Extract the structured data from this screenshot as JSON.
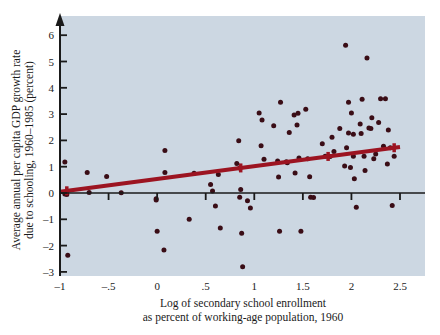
{
  "chart_data": {
    "type": "scatter",
    "title": "",
    "xlabel": "Log of secondary school enrollment as percent of working-age population, 1960",
    "xlabel_line1": "Log of secondary school enrollment",
    "xlabel_line2": "as percent of working-age population, 1960",
    "ylabel": "Average annual per capita GDP growth rate due to schooling, 1960–1985 (percent)",
    "ylabel_line1": "Average annual per capita GDP growth rate",
    "ylabel_line2": "due to schooling, 1960–1985 (percent)",
    "xlim": [
      -1,
      2.5
    ],
    "ylim": [
      -3,
      6.4
    ],
    "grid": false,
    "legend": "none",
    "xticks": [
      -1,
      -0.5,
      0,
      0.5,
      1,
      1.5,
      2,
      2.5
    ],
    "xtick_labels": [
      "–1",
      "–.5",
      "0",
      ".5",
      "1",
      "1.5",
      "2",
      "2.5"
    ],
    "yticks": [
      -3,
      -2,
      -1,
      0,
      1,
      2,
      3,
      4,
      5,
      6
    ],
    "ytick_labels": [
      "–3",
      "–2",
      "–1",
      "0",
      "1",
      "2",
      "3",
      "4",
      "5",
      "6"
    ],
    "point_color": "#3a0d16",
    "line_color": "#9c1421",
    "plot_bg_color": "#ccd7e2",
    "axis_color": "#1a1a1a",
    "trendline": {
      "x": [
        -1.0,
        2.5
      ],
      "y": [
        0.05,
        1.75
      ],
      "slope": 0.486,
      "intercept": 0.536,
      "markers_x": [
        -0.93,
        0.86,
        1.76,
        2.44
      ]
    },
    "points": [
      {
        "x": -0.95,
        "y": 1.18
      },
      {
        "x": -0.95,
        "y": -0.04
      },
      {
        "x": -0.93,
        "y": -0.06
      },
      {
        "x": -0.92,
        "y": -2.37
      },
      {
        "x": -0.72,
        "y": 0.78
      },
      {
        "x": -0.7,
        "y": 0.02
      },
      {
        "x": -0.52,
        "y": 0.63
      },
      {
        "x": -0.37,
        "y": 0.01
      },
      {
        "x": 0.08,
        "y": 1.62
      },
      {
        "x": 0.08,
        "y": 0.78
      },
      {
        "x": -0.01,
        "y": -0.22
      },
      {
        "x": -0.01,
        "y": -0.27
      },
      {
        "x": 0.0,
        "y": -1.45
      },
      {
        "x": 0.07,
        "y": -2.17
      },
      {
        "x": 0.33,
        "y": -1.0
      },
      {
        "x": 0.38,
        "y": 0.75
      },
      {
        "x": 0.55,
        "y": 0.32
      },
      {
        "x": 0.57,
        "y": 0.08
      },
      {
        "x": 0.6,
        "y": -0.49
      },
      {
        "x": 0.63,
        "y": 0.7
      },
      {
        "x": 0.65,
        "y": -1.33
      },
      {
        "x": 0.82,
        "y": 1.12
      },
      {
        "x": 0.84,
        "y": 1.99
      },
      {
        "x": 0.85,
        "y": 0.95
      },
      {
        "x": 0.86,
        "y": 0.13
      },
      {
        "x": 0.85,
        "y": -0.16
      },
      {
        "x": 0.87,
        "y": -1.53
      },
      {
        "x": 0.88,
        "y": -2.8
      },
      {
        "x": 0.93,
        "y": -0.29
      },
      {
        "x": 0.96,
        "y": -0.57
      },
      {
        "x": 1.05,
        "y": 3.04
      },
      {
        "x": 1.08,
        "y": 2.78
      },
      {
        "x": 1.07,
        "y": 1.8
      },
      {
        "x": 1.1,
        "y": 1.28
      },
      {
        "x": 1.2,
        "y": 2.56
      },
      {
        "x": 1.24,
        "y": 1.22
      },
      {
        "x": 1.25,
        "y": 0.61
      },
      {
        "x": 1.27,
        "y": 3.45
      },
      {
        "x": 1.26,
        "y": -1.45
      },
      {
        "x": 1.33,
        "y": 1.19
      },
      {
        "x": 1.34,
        "y": 1.15
      },
      {
        "x": 1.36,
        "y": 2.3
      },
      {
        "x": 1.41,
        "y": 2.97
      },
      {
        "x": 1.42,
        "y": 0.76
      },
      {
        "x": 1.44,
        "y": 2.59
      },
      {
        "x": 1.45,
        "y": 3.03
      },
      {
        "x": 1.46,
        "y": 1.33
      },
      {
        "x": 1.48,
        "y": -1.45
      },
      {
        "x": 1.53,
        "y": 3.18
      },
      {
        "x": 1.55,
        "y": 1.3
      },
      {
        "x": 1.57,
        "y": 0.62
      },
      {
        "x": 1.58,
        "y": -0.16
      },
      {
        "x": 1.61,
        "y": -0.17
      },
      {
        "x": 1.7,
        "y": 1.87
      },
      {
        "x": 1.73,
        "y": 1.4
      },
      {
        "x": 1.78,
        "y": 1.39
      },
      {
        "x": 1.8,
        "y": 2.12
      },
      {
        "x": 1.82,
        "y": 1.58
      },
      {
        "x": 1.88,
        "y": 2.45
      },
      {
        "x": 1.93,
        "y": 1.03
      },
      {
        "x": 1.94,
        "y": 5.62
      },
      {
        "x": 1.95,
        "y": 1.72
      },
      {
        "x": 1.97,
        "y": 3.45
      },
      {
        "x": 1.97,
        "y": 2.28
      },
      {
        "x": 1.99,
        "y": 0.97
      },
      {
        "x": 2.0,
        "y": 3.04
      },
      {
        "x": 2.02,
        "y": 2.23
      },
      {
        "x": 2.02,
        "y": 1.4
      },
      {
        "x": 2.03,
        "y": 0.54
      },
      {
        "x": 2.05,
        "y": -0.54
      },
      {
        "x": 2.09,
        "y": 2.62
      },
      {
        "x": 2.1,
        "y": 2.26
      },
      {
        "x": 2.11,
        "y": 3.56
      },
      {
        "x": 2.13,
        "y": 1.4
      },
      {
        "x": 2.14,
        "y": 0.86
      },
      {
        "x": 2.16,
        "y": 5.13
      },
      {
        "x": 2.18,
        "y": 2.47
      },
      {
        "x": 2.2,
        "y": 2.45
      },
      {
        "x": 2.21,
        "y": 2.86
      },
      {
        "x": 2.23,
        "y": 1.3
      },
      {
        "x": 2.25,
        "y": 1.48
      },
      {
        "x": 2.28,
        "y": 2.68
      },
      {
        "x": 2.3,
        "y": 3.58
      },
      {
        "x": 2.33,
        "y": 1.78
      },
      {
        "x": 2.35,
        "y": 3.58
      },
      {
        "x": 2.37,
        "y": 1.1
      },
      {
        "x": 2.38,
        "y": 2.4
      },
      {
        "x": 2.4,
        "y": 1.72
      },
      {
        "x": 2.42,
        "y": -0.48
      },
      {
        "x": 2.44,
        "y": 1.4
      }
    ]
  }
}
